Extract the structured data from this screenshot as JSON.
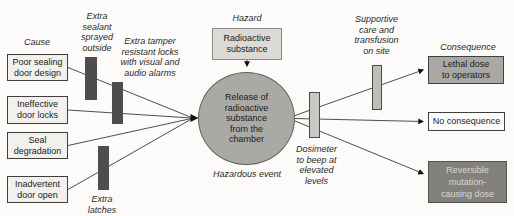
{
  "diagram": {
    "type": "bowtie-risk-diagram",
    "labels": {
      "cause": "Cause",
      "consequence": "Consequence",
      "hazard": "Hazard",
      "hazardous_event": "Hazardous event"
    },
    "hazard_box": "Radioactive\nsubstance",
    "event_circle": "Release of\nradioactive\nsubstance\nfrom the\nchamber",
    "causes": [
      "Poor sealing\ndoor design",
      "Ineffective\ndoor locks",
      "Seal\ndegradation",
      "Inadvertent\ndoor open"
    ],
    "preventive_barriers": [
      "Extra\nsealant\nsprayed\noutside",
      "Extra tamper\nresistant locks\nwith visual and\naudio alarms",
      "Extra\nlatches"
    ],
    "mitigative_barriers": [
      "Dosimeter\nto beep at\nelevated\nlevels",
      "Supportive\ncare and\ntransfusion\non site"
    ],
    "consequences": [
      "Lethal dose\nto operators",
      "No consequence",
      "Reversible\nmutation-\ncausing dose"
    ],
    "colors": {
      "background": "#fcfbf9",
      "barrier_dark": "#4e4d4b",
      "barrier_light": "#c9c8c4",
      "barrier_mid": "#bfbebb",
      "cause_fill": "#f2f1ed",
      "hazard_fill": "#dbdad6",
      "circle_fill": "#aaa9a5",
      "lethal_fill": "#a9a8a4",
      "no_consequence_fill": "#fdfcfa",
      "reversible_fill": "#82817d",
      "reversible_text": "#d8d7d3",
      "line": "#3a3a38"
    }
  }
}
